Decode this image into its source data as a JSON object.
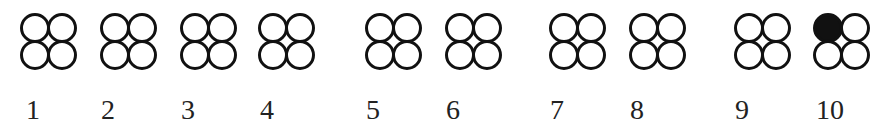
{
  "diagram": {
    "colors": {
      "stroke": "#111111",
      "fill_empty": "#ffffff",
      "fill_filled": "#111111"
    },
    "items": [
      {
        "label": "1",
        "x": 20,
        "label_x": 26,
        "filled": [
          false,
          false,
          false,
          false
        ]
      },
      {
        "label": "2",
        "x": 100,
        "label_x": 101,
        "filled": [
          false,
          false,
          false,
          false
        ]
      },
      {
        "label": "3",
        "x": 180,
        "label_x": 181,
        "filled": [
          false,
          false,
          false,
          false
        ]
      },
      {
        "label": "4",
        "x": 258,
        "label_x": 260,
        "filled": [
          false,
          false,
          false,
          false
        ]
      },
      {
        "label": "5",
        "x": 365,
        "label_x": 366,
        "filled": [
          false,
          false,
          false,
          false
        ]
      },
      {
        "label": "6",
        "x": 445,
        "label_x": 446,
        "filled": [
          false,
          false,
          false,
          false
        ]
      },
      {
        "label": "7",
        "x": 549,
        "label_x": 550,
        "filled": [
          false,
          false,
          false,
          false
        ]
      },
      {
        "label": "8",
        "x": 629,
        "label_x": 630,
        "filled": [
          false,
          false,
          false,
          false
        ]
      },
      {
        "label": "9",
        "x": 734,
        "label_x": 735,
        "filled": [
          false,
          false,
          false,
          false
        ]
      },
      {
        "label": "10",
        "x": 813,
        "label_x": 816,
        "filled": [
          true,
          false,
          false,
          false
        ]
      }
    ]
  }
}
